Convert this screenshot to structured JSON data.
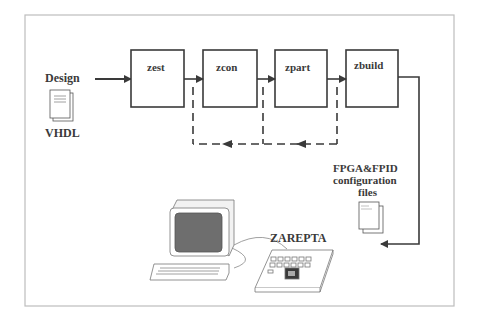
{
  "diagram": {
    "input": {
      "top_label": "Design",
      "bottom_label": "VHDL",
      "icon": "document-stack-icon"
    },
    "stages": [
      {
        "id": "zest",
        "label": "zest"
      },
      {
        "id": "zcon",
        "label": "zcon"
      },
      {
        "id": "zpart",
        "label": "zpart"
      },
      {
        "id": "zbuild",
        "label": "zbuild"
      }
    ],
    "output": {
      "label_line1": "FPGA&FPID",
      "label_line2": "configuration",
      "label_line3": "files",
      "icon": "document-stack-icon"
    },
    "hardware": {
      "label": "ZAREPTA",
      "computer_icon": "desktop-computer-icon",
      "board_icon": "fpga-board-icon"
    },
    "colors": {
      "line": "#3a3a3a",
      "frame": "#bdbdbd",
      "screen": "#6e6e6e",
      "background": "#ffffff"
    }
  }
}
